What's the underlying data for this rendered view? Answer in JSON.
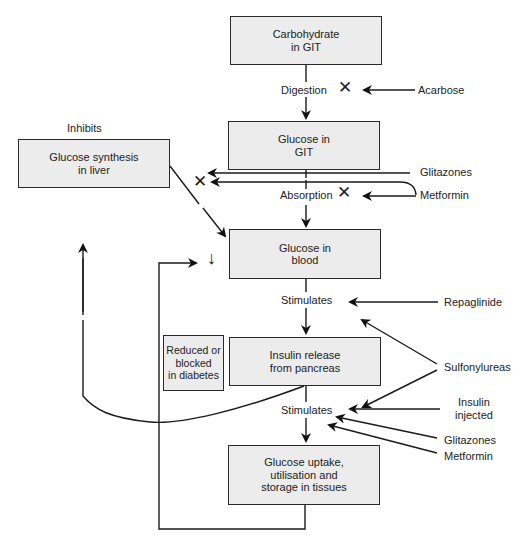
{
  "boxes": {
    "carbohydrate_git": "Carbohydrate\nin GIT",
    "glucose_git": "Glucose in\nGIT",
    "glucose_synthesis_liver": "Glucose synthesis\nin liver",
    "glucose_blood": "Glucose in\nblood",
    "reduced_blocked": "Reduced or\nblocked\nin diabetes",
    "insulin_release": "Insulin release\nfrom pancreas",
    "glucose_uptake": "Glucose uptake,\nutilisation and\nstorage in tissues"
  },
  "process_labels": {
    "digestion": "Digestion",
    "absorption": "Absorption",
    "stimulates_1": "Stimulates",
    "stimulates_2": "Stimulates",
    "inhibits": "Inhibits"
  },
  "drugs": {
    "acarbose": "Acarbose",
    "glitazones_top": "Glitazones",
    "metformin_top": "Metformin",
    "repaglinide": "Repaglinide",
    "sulfonylureas": "Sulfonylureas",
    "insulin_injected": "Insulin\ninjected",
    "glitazones_bottom": "Glitazones",
    "metformin_bottom": "Metformin"
  },
  "symbols": {
    "block_mark": "✕",
    "decrease_arrow": "↓"
  },
  "colors": {
    "box_fill": "#ececec",
    "line": "#1a1a1a"
  }
}
